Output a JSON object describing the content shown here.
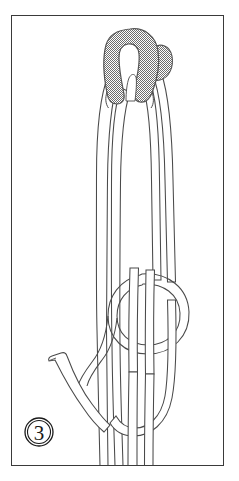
{
  "figure": {
    "kind": "knot-tying-instruction-diagram",
    "step_label": "3",
    "caption": "",
    "frame": {
      "x": 11,
      "y": 15,
      "width": 213,
      "height": 451,
      "border_color": "#3a3a3a",
      "background_color": "#ffffff"
    },
    "colors": {
      "rope_outline": "#4a4a4a",
      "rope_fill": "#ffffff",
      "shaded_rope_fill": "#9a9a9a",
      "shaded_rope_outline": "#555555",
      "frame_border": "#3a3a3a",
      "badge_stroke": "#1a1a1a",
      "page_background": "#ffffff"
    },
    "elements": [
      {
        "name": "shaded-ring-bight",
        "description": "Gray stippled rope bight at top forming the ring the working loop passes through",
        "shaded": true
      },
      {
        "name": "shaded-ring-small-lobe",
        "description": "Small gray stippled lobe to the right of the main shaded bight",
        "shaded": true
      },
      {
        "name": "outer-bight-loop",
        "description": "Long white outer loop rising from the bottom up through the shaded ring",
        "shaded": false
      },
      {
        "name": "inner-bight-loop",
        "description": "Long white inner loop nested inside the outer loop",
        "shaded": false
      },
      {
        "name": "overhand-knot-ring",
        "description": "Circular white loop of the overhand knot in the lower middle",
        "shaded": false
      },
      {
        "name": "standing-part-strands",
        "description": "Pair of near-vertical rope strands running to the bottom frame edge",
        "shaded": false
      },
      {
        "name": "working-end-tail",
        "description": "Short rope tail with blunt cut end at lower left angling down to the right",
        "shaded": false
      },
      {
        "name": "bottom-u-bend",
        "description": "U shaped bend of rope at the bottom right of the knot",
        "shaded": false
      }
    ],
    "step_badge": {
      "cx": 39,
      "cy": 432,
      "outer_r": 14,
      "inner_r": 11.5,
      "label": "3"
    }
  }
}
